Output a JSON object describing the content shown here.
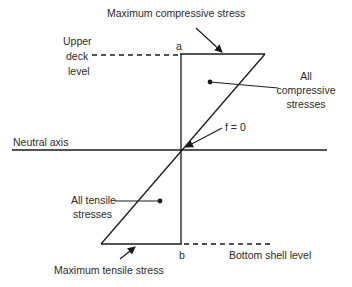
{
  "diagram": {
    "title_label": "Maximum compressive stress",
    "upper_deck": [
      "Upper",
      "deck",
      "level"
    ],
    "point_a": "a",
    "point_b": "b",
    "compressive": [
      "All",
      "compressive",
      "stresses"
    ],
    "neutral_axis": "Neutral axis",
    "zero_stress": "f = 0",
    "tensile": [
      "All tensile",
      "stresses"
    ],
    "max_tensile": "Maximum tensile stress",
    "bottom_shell": "Bottom shell level",
    "colors": {
      "line": "#1a1a1a",
      "background": "#ffffff"
    }
  }
}
